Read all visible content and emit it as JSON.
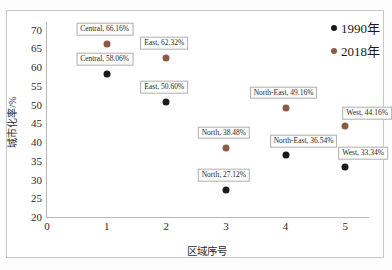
{
  "chart_data": {
    "type": "scatter",
    "title": "",
    "xlabel": "区域序号",
    "ylabel": "城市化率/%",
    "xlim": [
      0,
      5.4
    ],
    "ylim": [
      20,
      72
    ],
    "xticks": [
      "0",
      "1",
      "2",
      "3",
      "4",
      "5"
    ],
    "yticks": [
      "20",
      "25",
      "30",
      "35",
      "40",
      "45",
      "50",
      "55",
      "60",
      "65",
      "70"
    ],
    "grid": false,
    "legend_position": "top-right",
    "categories": [
      "Central",
      "East",
      "North",
      "North-East",
      "West"
    ],
    "x": [
      1,
      2,
      3,
      4,
      5
    ],
    "series": [
      {
        "name": "1990年",
        "color": "#1a1a1a",
        "values": [
          58.06,
          50.6,
          27.12,
          36.54,
          33.34
        ],
        "point_labels": [
          "Central, 58.06%",
          "East, 50.60%",
          "North, 27.12%",
          "North-East, 36.54%",
          "West, 33.34%"
        ]
      },
      {
        "name": "2018年",
        "color": "#8b5a46",
        "values": [
          66.16,
          62.32,
          38.48,
          49.16,
          44.16
        ],
        "point_labels": [
          "Central, 66.16%",
          "East, 62.32%",
          "North, 38.48%",
          "North-East, 49.16%",
          "West, 44.16%"
        ]
      }
    ]
  },
  "legend": {
    "items": [
      {
        "label": "1990年"
      },
      {
        "label": "2018年"
      }
    ]
  }
}
